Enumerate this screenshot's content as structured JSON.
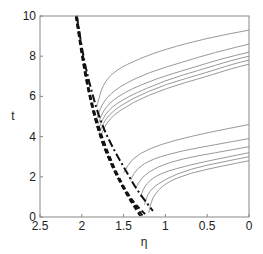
{
  "chart_data": {
    "type": "line",
    "title": "",
    "xlabel": "η",
    "ylabel": "t",
    "xlim": [
      2.5,
      0
    ],
    "ylim": [
      0,
      10
    ],
    "x_reversed": true,
    "grid": false,
    "legend": null,
    "xticks": [
      "2.5",
      "2",
      "1.5",
      "1",
      "0.5",
      "0"
    ],
    "xtick_values": [
      2.5,
      2,
      1.5,
      1,
      0.5,
      0
    ],
    "yticks": [
      "0",
      "2",
      "4",
      "6",
      "8",
      "10"
    ],
    "ytick_values": [
      0,
      2,
      4,
      6,
      8,
      10
    ],
    "series": [
      {
        "name": "upper-1",
        "style": "solid",
        "color": "#999999",
        "points": [
          [
            1.82,
            5.5
          ],
          [
            1.75,
            6.6
          ],
          [
            1.6,
            7.3
          ],
          [
            1.3,
            7.9
          ],
          [
            1.0,
            8.35
          ],
          [
            0.5,
            8.9
          ],
          [
            0.0,
            9.3
          ]
        ]
      },
      {
        "name": "upper-2",
        "style": "solid",
        "color": "#999999",
        "points": [
          [
            1.82,
            4.9
          ],
          [
            1.74,
            5.8
          ],
          [
            1.55,
            6.5
          ],
          [
            1.2,
            7.2
          ],
          [
            0.8,
            7.7
          ],
          [
            0.4,
            8.2
          ],
          [
            0.0,
            8.6
          ]
        ]
      },
      {
        "name": "upper-3",
        "style": "solid",
        "color": "#999999",
        "points": [
          [
            1.81,
            4.6
          ],
          [
            1.72,
            5.5
          ],
          [
            1.5,
            6.2
          ],
          [
            1.1,
            6.9
          ],
          [
            0.7,
            7.4
          ],
          [
            0.3,
            7.9
          ],
          [
            0.0,
            8.2
          ]
        ]
      },
      {
        "name": "upper-4",
        "style": "solid",
        "color": "#999999",
        "points": [
          [
            1.8,
            4.4
          ],
          [
            1.7,
            5.3
          ],
          [
            1.45,
            6.0
          ],
          [
            1.0,
            6.8
          ],
          [
            0.6,
            7.3
          ],
          [
            0.2,
            7.8
          ],
          [
            0.0,
            8.0
          ]
        ]
      },
      {
        "name": "upper-5",
        "style": "solid",
        "color": "#999999",
        "points": [
          [
            1.79,
            4.2
          ],
          [
            1.69,
            5.1
          ],
          [
            1.4,
            5.9
          ],
          [
            1.0,
            6.6
          ],
          [
            0.5,
            7.2
          ],
          [
            0.2,
            7.6
          ],
          [
            0.0,
            7.8
          ]
        ]
      },
      {
        "name": "upper-6",
        "style": "solid",
        "color": "#999999",
        "points": [
          [
            1.78,
            4.0
          ],
          [
            1.68,
            4.9
          ],
          [
            1.4,
            5.7
          ],
          [
            1.0,
            6.4
          ],
          [
            0.5,
            7.0
          ],
          [
            0.2,
            7.4
          ],
          [
            0.0,
            7.6
          ]
        ]
      },
      {
        "name": "lower-1",
        "style": "solid",
        "color": "#999999",
        "points": [
          [
            1.5,
            2.2
          ],
          [
            1.4,
            2.9
          ],
          [
            1.2,
            3.4
          ],
          [
            0.9,
            3.8
          ],
          [
            0.5,
            4.2
          ],
          [
            0.0,
            4.6
          ]
        ]
      },
      {
        "name": "lower-2",
        "style": "solid",
        "color": "#999999",
        "points": [
          [
            1.42,
            1.8
          ],
          [
            1.35,
            2.4
          ],
          [
            1.15,
            2.9
          ],
          [
            0.8,
            3.3
          ],
          [
            0.4,
            3.6
          ],
          [
            0.0,
            3.9
          ]
        ]
      },
      {
        "name": "lower-3",
        "style": "solid",
        "color": "#999999",
        "points": [
          [
            1.36,
            1.4
          ],
          [
            1.28,
            2.0
          ],
          [
            1.1,
            2.5
          ],
          [
            0.8,
            2.9
          ],
          [
            0.4,
            3.2
          ],
          [
            0.0,
            3.5
          ]
        ]
      },
      {
        "name": "lower-4",
        "style": "solid",
        "color": "#999999",
        "points": [
          [
            1.3,
            1.0
          ],
          [
            1.23,
            1.7
          ],
          [
            1.05,
            2.2
          ],
          [
            0.7,
            2.6
          ],
          [
            0.3,
            2.95
          ],
          [
            0.0,
            3.2
          ]
        ]
      },
      {
        "name": "lower-5",
        "style": "solid",
        "color": "#999999",
        "points": [
          [
            1.25,
            0.6
          ],
          [
            1.2,
            1.3
          ],
          [
            1.0,
            1.9
          ],
          [
            0.7,
            2.4
          ],
          [
            0.3,
            2.75
          ],
          [
            0.0,
            3.0
          ]
        ]
      },
      {
        "name": "lower-6",
        "style": "solid",
        "color": "#999999",
        "points": [
          [
            1.2,
            0.2
          ],
          [
            1.16,
            1.0
          ],
          [
            1.0,
            1.7
          ],
          [
            0.7,
            2.2
          ],
          [
            0.3,
            2.55
          ],
          [
            0.0,
            2.8
          ]
        ]
      },
      {
        "name": "dashed-1",
        "style": "dashed",
        "color": "#111111",
        "points": [
          [
            2.07,
            10
          ],
          [
            2.0,
            8.2
          ],
          [
            1.93,
            6.5
          ],
          [
            1.85,
            5.0
          ],
          [
            1.75,
            3.6
          ],
          [
            1.6,
            2.2
          ],
          [
            1.45,
            1.0
          ],
          [
            1.3,
            0.05
          ]
        ]
      },
      {
        "name": "dashed-2",
        "style": "dashed",
        "color": "#111111",
        "points": [
          [
            2.07,
            10
          ],
          [
            2.0,
            8.0
          ],
          [
            1.92,
            6.2
          ],
          [
            1.83,
            4.7
          ],
          [
            1.72,
            3.3
          ],
          [
            1.58,
            2.0
          ],
          [
            1.42,
            0.9
          ],
          [
            1.27,
            0.05
          ]
        ]
      },
      {
        "name": "dashed-3",
        "style": "dashed",
        "color": "#111111",
        "points": [
          [
            2.06,
            10
          ],
          [
            1.98,
            7.8
          ],
          [
            1.9,
            6.0
          ],
          [
            1.8,
            4.5
          ],
          [
            1.68,
            3.1
          ],
          [
            1.55,
            1.9
          ],
          [
            1.4,
            0.8
          ],
          [
            1.22,
            0.05
          ]
        ]
      },
      {
        "name": "dash-dot",
        "style": "dashdot",
        "color": "#111111",
        "points": [
          [
            2.06,
            10
          ],
          [
            1.97,
            7.7
          ],
          [
            1.88,
            6.2
          ],
          [
            1.78,
            4.8
          ],
          [
            1.65,
            3.6
          ],
          [
            1.5,
            2.5
          ],
          [
            1.35,
            1.4
          ],
          [
            1.15,
            0.3
          ]
        ]
      }
    ]
  }
}
